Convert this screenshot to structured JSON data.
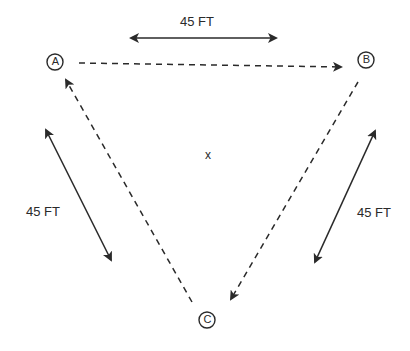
{
  "diagram": {
    "title": "",
    "nodes": [
      {
        "id": "A",
        "label": "A",
        "cx": 55,
        "cy": 62
      },
      {
        "id": "B",
        "label": "B",
        "cx": 366,
        "cy": 60
      },
      {
        "id": "C",
        "label": "C",
        "cx": 207,
        "cy": 320
      }
    ],
    "passes": [
      {
        "from": "A",
        "to": "B",
        "style": "dashed"
      },
      {
        "from": "B",
        "to": "C",
        "style": "dashed"
      },
      {
        "from": "C",
        "to": "A",
        "style": "dashed"
      }
    ],
    "distances": {
      "top": "45 FT",
      "left": "45 FT",
      "right": "45 FT"
    },
    "center_mark": "x",
    "colors": {
      "line": "#2a2a2a",
      "background": "#ffffff"
    }
  }
}
